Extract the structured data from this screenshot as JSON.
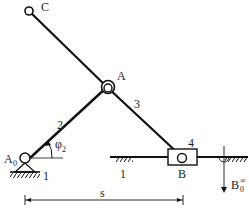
{
  "diagram": {
    "type": "slider-crank mechanism",
    "colors": {
      "stroke": "#111111",
      "background": "#ffffff"
    },
    "points": {
      "C": {
        "label": "C"
      },
      "A": {
        "label": "A"
      },
      "A0": {
        "label": "A",
        "sub": "0"
      },
      "B": {
        "label": "B"
      },
      "B0": {
        "label": "B",
        "sub": "0",
        "sup": "∞"
      }
    },
    "links": {
      "frame_left": "1",
      "frame_right": "1",
      "crank": "2",
      "coupler": "3",
      "slider": "4"
    },
    "angle": {
      "symbol": "φ",
      "sub": "2"
    },
    "dimension": {
      "label": "s"
    }
  }
}
